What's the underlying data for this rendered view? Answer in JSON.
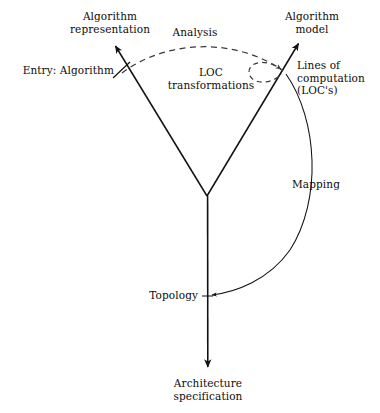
{
  "diagram": {
    "background_color": "#ffffff",
    "stroke_color": "#111111",
    "dashed_stroke_color": "#444444",
    "labels": {
      "algorithm_representation": "Algorithm\nrepresentation",
      "entry_algorithm": "Entry: Algorithm",
      "analysis": "Analysis",
      "loc_transformations": "LOC\ntransformations",
      "algorithm_model": "Algorithm\nmodel",
      "lines_of_computation": "Lines of\ncomputation\n(LOC's)",
      "mapping": "Mapping",
      "topology": "Topology",
      "architecture_specification": "Architecture\nspecification",
      "caption_cut_off": " "
    },
    "nodes": [
      {
        "name": "algorithm-representation-tip",
        "x": 113,
        "y": 43
      },
      {
        "name": "entry-algorithm-crossing",
        "x": 122,
        "y": 72
      },
      {
        "name": "center-junction",
        "x": 207,
        "y": 196
      },
      {
        "name": "loc-vertex",
        "x": 284,
        "y": 72
      },
      {
        "name": "algorithm-model-tip",
        "x": 301,
        "y": 40
      },
      {
        "name": "topology-point",
        "x": 208,
        "y": 296
      },
      {
        "name": "architecture-spec-tip",
        "x": 208,
        "y": 371
      }
    ],
    "edges": [
      {
        "name": "left-branch",
        "from": "center-junction",
        "to": "algorithm-representation-tip",
        "style": "solid",
        "arrow": "end"
      },
      {
        "name": "right-branch",
        "from": "center-junction",
        "to": "algorithm-model-tip",
        "style": "solid",
        "arrow": "end"
      },
      {
        "name": "trunk",
        "from": "center-junction",
        "to": "architecture-spec-tip",
        "style": "solid",
        "arrow": "end"
      },
      {
        "name": "analysis-arc",
        "from": "entry-algorithm-crossing",
        "to": "loc-vertex",
        "style": "dashed",
        "arrow": "end"
      },
      {
        "name": "loc-self-loop",
        "from": "loc-vertex",
        "to": "loc-vertex",
        "style": "dashed",
        "arrow": "none"
      },
      {
        "name": "mapping-arc",
        "from": "loc-vertex",
        "to": "topology-point",
        "style": "solid",
        "arrow": "end"
      }
    ]
  }
}
